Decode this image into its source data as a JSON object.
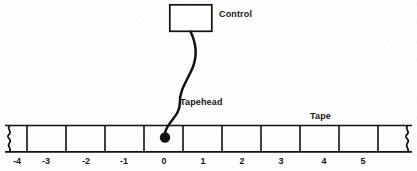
{
  "diagram": {
    "background_color": "#fdfdfd",
    "stroke_color": "#111111",
    "labels": {
      "control": "Control",
      "tapehead": "Tapehead",
      "tape": "Tape"
    },
    "control_box": {
      "x": 169,
      "y": 4,
      "width": 43,
      "height": 28,
      "fill": "#ffffff",
      "stroke": "#111111",
      "stroke_width": 1.6
    },
    "tapehead": {
      "dot_x": 165,
      "dot_y": 138,
      "dot_radius": 5,
      "curve_start_x": 190,
      "curve_start_y": 32,
      "stroke_width": 2.4
    },
    "tape": {
      "left": 5,
      "right": 412,
      "top": 125,
      "bottom": 152,
      "stroke_width": 1.6,
      "dividers": [
        27,
        66,
        105,
        144,
        183,
        222,
        261,
        300,
        339,
        378
      ],
      "torn_left_x": 9,
      "torn_right_x": 408,
      "cells": [
        {
          "label": "-4",
          "center_x": 17
        },
        {
          "label": "-3",
          "center_x": 46
        },
        {
          "label": "-2",
          "center_x": 86
        },
        {
          "label": "-1",
          "center_x": 124
        },
        {
          "label": "0",
          "center_x": 164
        },
        {
          "label": "1",
          "center_x": 203
        },
        {
          "label": "2",
          "center_x": 242
        },
        {
          "label": "3",
          "center_x": 281
        },
        {
          "label": "4",
          "center_x": 324
        },
        {
          "label": "5",
          "center_x": 363
        }
      ]
    }
  }
}
